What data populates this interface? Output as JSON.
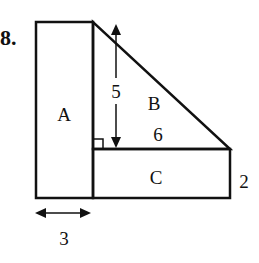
{
  "problem": {
    "number": "8."
  },
  "figure": {
    "regions": [
      {
        "label": "A",
        "shape": "rectangle"
      },
      {
        "label": "B",
        "shape": "right-triangle"
      },
      {
        "label": "C",
        "shape": "rectangle"
      }
    ],
    "dimensions": {
      "triangle_height": "5",
      "triangle_base": "6",
      "rect_c_height": "2",
      "rect_a_width": "3"
    }
  }
}
